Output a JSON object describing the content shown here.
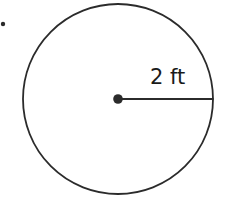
{
  "diagram": {
    "shape": "circle",
    "radius_label": "2 ft",
    "colors": {
      "stroke": "#2b2b2b",
      "background": "#ffffff"
    }
  }
}
